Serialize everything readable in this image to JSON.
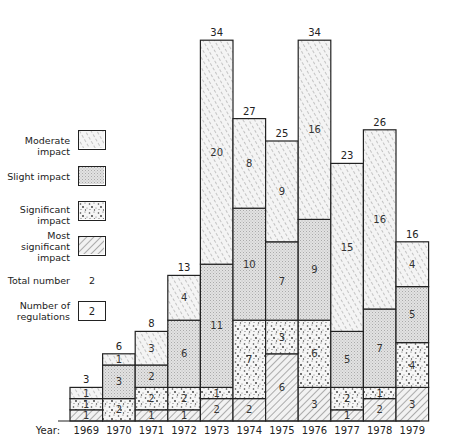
{
  "chart_data": {
    "type": "bar",
    "stacked": true,
    "title": "",
    "xlabel": "Year",
    "ylabel": "Number of regulations",
    "categories": [
      "1969",
      "1970",
      "1971",
      "1972",
      "1973",
      "1974",
      "1975",
      "1976",
      "1977",
      "1978",
      "1979"
    ],
    "series": [
      {
        "name": "Most significant impact",
        "pattern": "dense-hatch",
        "values": [
          1,
          0,
          1,
          1,
          2,
          2,
          6,
          3,
          1,
          2,
          3
        ]
      },
      {
        "name": "Significant impact",
        "pattern": "dots",
        "values": [
          1,
          2,
          2,
          2,
          1,
          7,
          3,
          6,
          2,
          1,
          4
        ]
      },
      {
        "name": "Slight impact",
        "pattern": "fine-stipple",
        "values": [
          0,
          3,
          2,
          6,
          11,
          10,
          7,
          9,
          5,
          7,
          5
        ]
      },
      {
        "name": "Moderate impact",
        "pattern": "light-hatch",
        "values": [
          1,
          1,
          3,
          4,
          20,
          8,
          9,
          16,
          15,
          16,
          4
        ]
      }
    ],
    "totals": [
      3,
      6,
      8,
      13,
      34,
      27,
      25,
      34,
      23,
      26,
      16
    ],
    "legend_position": "left",
    "grid": false
  },
  "legend": {
    "items": [
      {
        "label_line1": "Moderate",
        "label_line2": "impact",
        "pattern": "light-hatch"
      },
      {
        "label_line1": "Slight impact",
        "label_line2": "",
        "pattern": "fine-stipple"
      },
      {
        "label_line1": "Significant",
        "label_line2": "impact",
        "pattern": "dots"
      },
      {
        "label_line1": "Most",
        "label_line2": "significant",
        "label_line3": "impact",
        "pattern": "dense-hatch"
      }
    ],
    "total_label": "Total number",
    "total_example": "2",
    "count_label_line1": "Number of",
    "count_label_line2": "regulations",
    "count_example": "2"
  },
  "axis": {
    "year_label": "Year:"
  }
}
